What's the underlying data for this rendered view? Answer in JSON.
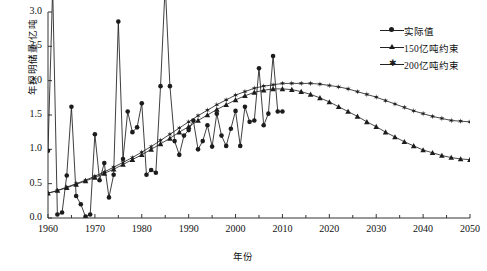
{
  "chart_data": {
    "type": "line",
    "title": "",
    "xlabel": "年份",
    "ylabel": "年探明储量/亿吨",
    "xlim": [
      1960,
      2050
    ],
    "ylim": [
      0.0,
      3.0
    ],
    "xticks": [
      "1960",
      "1970",
      "1980",
      "1990",
      "2000",
      "2010",
      "2020",
      "2030",
      "2040",
      "2050"
    ],
    "yticks": [
      "0.0",
      "0.5",
      "1.0",
      "1.5",
      "2.0",
      "2.5",
      "3.0"
    ],
    "grid": false,
    "legend_position": "top-right",
    "series": [
      {
        "name": "实际值",
        "marker": "circle",
        "color": "#1c1c1c",
        "x": [
          1960,
          1961,
          1962,
          1963,
          1964,
          1965,
          1966,
          1967,
          1968,
          1969,
          1970,
          1971,
          1972,
          1973,
          1974,
          1975,
          1976,
          1977,
          1978,
          1979,
          1980,
          1981,
          1982,
          1983,
          1984,
          1985,
          1986,
          1987,
          1988,
          1989,
          1990,
          1991,
          1992,
          1993,
          1994,
          1995,
          1996,
          1997,
          1998,
          1999,
          2000,
          2001,
          2002,
          2003,
          2004,
          2005,
          2006,
          2007,
          2008,
          2009,
          2010
        ],
        "values": [
          0.98,
          3.35,
          0.05,
          0.08,
          0.62,
          1.62,
          0.32,
          0.2,
          0.02,
          0.05,
          1.22,
          0.55,
          0.8,
          0.3,
          0.63,
          2.86,
          0.86,
          1.55,
          1.25,
          1.32,
          1.67,
          0.63,
          0.7,
          0.66,
          1.92,
          3.4,
          1.92,
          1.12,
          0.92,
          1.2,
          1.28,
          1.42,
          1.0,
          1.12,
          1.35,
          1.04,
          1.52,
          1.2,
          1.05,
          1.3,
          1.56,
          1.05,
          1.62,
          1.4,
          1.42,
          2.18,
          1.35,
          1.52,
          2.36,
          1.55,
          1.55
        ]
      },
      {
        "name": "150亿吨约束",
        "marker": "triangle",
        "color": "#1c1c1c",
        "x": [
          1960,
          1962,
          1964,
          1966,
          1968,
          1970,
          1972,
          1974,
          1976,
          1978,
          1980,
          1982,
          1984,
          1986,
          1988,
          1990,
          1992,
          1994,
          1996,
          1998,
          2000,
          2002,
          2004,
          2006,
          2008,
          2010,
          2012,
          2014,
          2016,
          2018,
          2020,
          2022,
          2024,
          2026,
          2028,
          2030,
          2032,
          2034,
          2036,
          2038,
          2040,
          2042,
          2044,
          2046,
          2048,
          2050
        ],
        "values": [
          0.36,
          0.4,
          0.44,
          0.49,
          0.54,
          0.59,
          0.65,
          0.71,
          0.78,
          0.85,
          0.92,
          1.0,
          1.08,
          1.16,
          1.25,
          1.33,
          1.42,
          1.5,
          1.58,
          1.65,
          1.72,
          1.78,
          1.83,
          1.86,
          1.88,
          1.88,
          1.87,
          1.84,
          1.8,
          1.75,
          1.69,
          1.62,
          1.55,
          1.48,
          1.4,
          1.33,
          1.25,
          1.18,
          1.11,
          1.05,
          0.99,
          0.95,
          0.91,
          0.88,
          0.86,
          0.85
        ]
      },
      {
        "name": "200亿吨约束",
        "marker": "star",
        "color": "#1c1c1c",
        "x": [
          1960,
          1962,
          1964,
          1966,
          1968,
          1970,
          1972,
          1974,
          1976,
          1978,
          1980,
          1982,
          1984,
          1986,
          1988,
          1990,
          1992,
          1994,
          1996,
          1998,
          2000,
          2002,
          2004,
          2006,
          2008,
          2010,
          2012,
          2014,
          2016,
          2018,
          2020,
          2022,
          2024,
          2026,
          2028,
          2030,
          2032,
          2034,
          2036,
          2038,
          2040,
          2042,
          2044,
          2046,
          2048,
          2050
        ],
        "values": [
          0.36,
          0.4,
          0.45,
          0.5,
          0.55,
          0.61,
          0.67,
          0.74,
          0.81,
          0.88,
          0.96,
          1.04,
          1.13,
          1.22,
          1.31,
          1.4,
          1.49,
          1.57,
          1.65,
          1.72,
          1.79,
          1.84,
          1.89,
          1.92,
          1.94,
          1.96,
          1.96,
          1.96,
          1.96,
          1.95,
          1.93,
          1.91,
          1.88,
          1.84,
          1.8,
          1.76,
          1.71,
          1.66,
          1.61,
          1.56,
          1.52,
          1.48,
          1.45,
          1.42,
          1.41,
          1.4
        ]
      }
    ]
  },
  "legend": {
    "items": [
      {
        "label": "实际值"
      },
      {
        "label": "150亿吨约束"
      },
      {
        "label": "200亿吨约束"
      }
    ]
  }
}
